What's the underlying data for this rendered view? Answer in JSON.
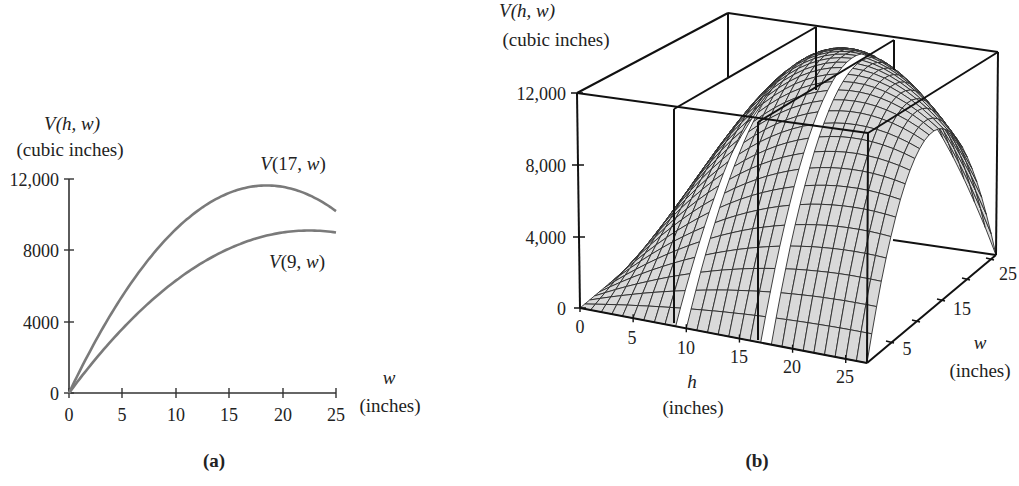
{
  "chart_data": [
    {
      "panel": "(a)",
      "type": "line",
      "title": "",
      "xlabel": "w",
      "xlabel_units": "(inches)",
      "ylabel": "V(h, w)",
      "ylabel_units": "(cubic inches)",
      "xlim": [
        0,
        25
      ],
      "ylim": [
        0,
        12000
      ],
      "x_ticks": [
        0,
        5,
        10,
        15,
        20,
        25
      ],
      "x_tick_labels": [
        "0",
        "5",
        "10",
        "15",
        "20",
        "25"
      ],
      "y_ticks": [
        0,
        4000,
        8000,
        12000
      ],
      "y_tick_labels": [
        "0",
        "4000",
        "8000",
        "12,000"
      ],
      "grid": false,
      "x": [
        0,
        2.5,
        5,
        7.5,
        10,
        12.5,
        15,
        17.5,
        20,
        22.5,
        25
      ],
      "series": [
        {
          "name": "V(17, w)",
          "values": [
            0,
            3038,
            5950,
            8734,
            11390,
            13919,
            11475,
            11603,
            11560,
            11348,
            10200
          ],
          "label": "V(17, w)",
          "color": "#777777"
        },
        {
          "name": "V(9, w)",
          "values": [
            0,
            1913,
            3600,
            5063,
            6300,
            7313,
            8100,
            8663,
            9000,
            9113,
            9000
          ],
          "label": "V(9, w)",
          "color": "#777777"
        }
      ],
      "formula": "V(h, w) = h·w·(108 − 2h − 2w)",
      "caption": "(a)"
    },
    {
      "panel": "(b)",
      "type": "surface3d",
      "title": "",
      "xlabel": "h",
      "xlabel_units": "(inches)",
      "ylabel": "w",
      "ylabel_units": "(inches)",
      "zlabel": "V(h, w)",
      "zlabel_units": "(cubic inches)",
      "xlim": [
        0,
        27
      ],
      "ylim": [
        0,
        27
      ],
      "zlim": [
        0,
        12000
      ],
      "h_tick_labels": [
        "0",
        "5",
        "10",
        "15",
        "20",
        "25"
      ],
      "w_tick_labels": [
        "5",
        "15",
        "25"
      ],
      "z_tick_labels": [
        "0",
        "4,000",
        "8,000",
        "12,000"
      ],
      "slice_planes_h": [
        9,
        17
      ],
      "formula": "V(h, w) = h·w·(108 − 2h − 2w)",
      "surface_color": "#d8d8d8",
      "caption": "(b)"
    }
  ],
  "panel_a": {
    "y_title": "V(h, w)",
    "y_units": "(cubic inches)",
    "x_title": "w",
    "x_units": "(inches)",
    "y_ticks": [
      "12,000",
      "8000",
      "4000",
      "0"
    ],
    "x_ticks": [
      "0",
      "5",
      "10",
      "15",
      "20",
      "25"
    ],
    "curve_17_label": "V(17, w)",
    "curve_9_label": "V(9, w)",
    "caption": "(a)"
  },
  "panel_b": {
    "z_title": "V(h, w)",
    "z_units": "(cubic inches)",
    "z_ticks": [
      "12,000",
      "8,000",
      "4,000",
      "0"
    ],
    "h_ticks": [
      "0",
      "5",
      "10",
      "15",
      "20",
      "25"
    ],
    "h_title": "h",
    "h_units": "(inches)",
    "w_ticks": [
      "5",
      "15",
      "25"
    ],
    "w_title": "w",
    "w_units": "(inches)",
    "caption": "(b)"
  }
}
